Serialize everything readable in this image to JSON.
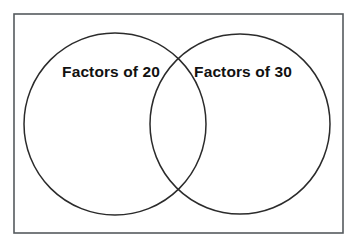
{
  "diagram": {
    "type": "venn-two-set",
    "title_visible": false,
    "background_color": "#ffffff",
    "frame": {
      "stroke_color": "#555a5e",
      "x": 14,
      "y": 14,
      "width": 329,
      "height": 219
    },
    "stroke_color": "#2b2b2b",
    "text_color": "#111111",
    "sets": [
      {
        "id": "left",
        "label": "Factors of 20",
        "center_x": 115,
        "center_y": 124,
        "radius": 91,
        "label_x": 111,
        "label_y": 73
      },
      {
        "id": "right",
        "label": "Factors of 30",
        "center_x": 240,
        "center_y": 124,
        "radius": 90,
        "label_x": 243,
        "label_y": 73
      }
    ],
    "regions": {
      "left_only_items": [],
      "intersection_items": [],
      "right_only_items": []
    }
  }
}
